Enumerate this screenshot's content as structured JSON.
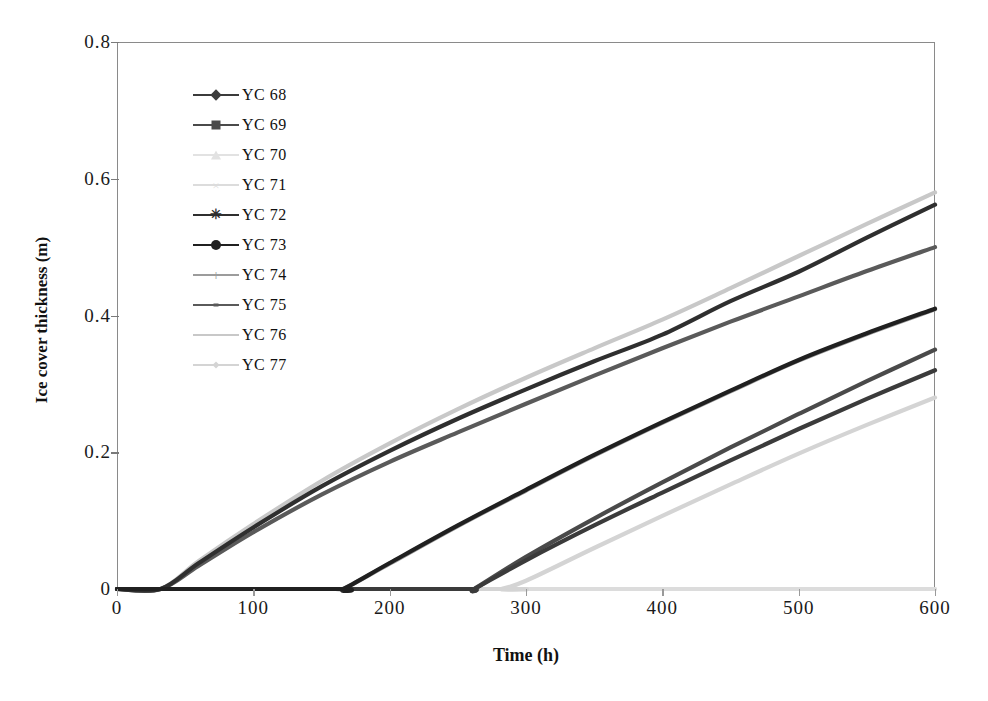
{
  "chart_data": {
    "type": "line",
    "title": "",
    "xlabel": "Time (h)",
    "ylabel": "Ice cover thickness (m)",
    "xlim": [
      0,
      600
    ],
    "ylim": [
      0,
      0.8
    ],
    "xticks": [
      0,
      100,
      200,
      300,
      400,
      500,
      600
    ],
    "yticks": [
      "0",
      "0.2",
      "0.4",
      "0.6",
      "0.8"
    ],
    "xtick_labels": [
      "0",
      "100",
      "200",
      "300",
      "400",
      "500",
      "600"
    ],
    "grid": false,
    "legend_position": "upper-left-inside",
    "series": [
      {
        "name": "YC 68",
        "marker": "diamond",
        "color": "#3b3b3b",
        "onset_h": 262,
        "final_value": 0.32,
        "x": [
          0,
          100,
          200,
          260,
          262,
          300,
          350,
          400,
          450,
          500,
          550,
          600
        ],
        "values": [
          0,
          0,
          0,
          0,
          0,
          0.042,
          0.093,
          0.141,
          0.188,
          0.234,
          0.278,
          0.32
        ]
      },
      {
        "name": "YC 69",
        "marker": "square",
        "color": "#4a4a4a",
        "onset_h": 262,
        "final_value": 0.35,
        "x": [
          0,
          100,
          200,
          260,
          262,
          300,
          350,
          400,
          450,
          500,
          550,
          600
        ],
        "values": [
          0,
          0,
          0,
          0,
          0,
          0.047,
          0.103,
          0.156,
          0.207,
          0.256,
          0.304,
          0.35
        ]
      },
      {
        "name": "YC 70",
        "marker": "triangle",
        "color": "#e2e2e2",
        "onset_h": null,
        "final_value": 0.0,
        "x": [
          0,
          100,
          200,
          300,
          400,
          500,
          600
        ],
        "values": [
          0,
          0,
          0,
          0,
          0,
          0,
          0
        ]
      },
      {
        "name": "YC 71",
        "marker": "cross-x",
        "color": "#dcdcdc",
        "onset_h": null,
        "final_value": 0.0,
        "x": [
          0,
          100,
          200,
          300,
          400,
          500,
          600
        ],
        "values": [
          0,
          0,
          0,
          0,
          0,
          0,
          0
        ]
      },
      {
        "name": "YC 72",
        "marker": "star-x",
        "color": "#2f2f2f",
        "onset_h": 32,
        "final_value": 0.562,
        "x": [
          0,
          32,
          60,
          100,
          150,
          200,
          250,
          300,
          350,
          400,
          450,
          500,
          550,
          600
        ],
        "values": [
          0,
          0,
          0.038,
          0.09,
          0.15,
          0.202,
          0.249,
          0.292,
          0.333,
          0.372,
          0.421,
          0.464,
          0.514,
          0.562
        ]
      },
      {
        "name": "YC 73",
        "marker": "circle",
        "color": "#202020",
        "onset_h": 166,
        "final_value": 0.41,
        "x": [
          0,
          160,
          166,
          200,
          250,
          300,
          350,
          400,
          450,
          500,
          550,
          600
        ],
        "values": [
          0,
          0,
          0,
          0.038,
          0.093,
          0.145,
          0.196,
          0.244,
          0.29,
          0.335,
          0.374,
          0.41
        ]
      },
      {
        "name": "YC 74",
        "marker": "plus",
        "color": "#9c9c9c",
        "onset_h": 166,
        "final_value": 0.41,
        "x": [
          0,
          160,
          166,
          200,
          250,
          300,
          350,
          400,
          450,
          500,
          550,
          600
        ],
        "values": [
          0,
          0,
          0,
          0.037,
          0.092,
          0.144,
          0.195,
          0.243,
          0.289,
          0.334,
          0.373,
          0.409
        ]
      },
      {
        "name": "YC 75",
        "marker": "line-dot",
        "color": "#5a5a5a",
        "onset_h": 32,
        "final_value": 0.5,
        "x": [
          0,
          32,
          60,
          100,
          150,
          200,
          250,
          300,
          350,
          400,
          450,
          500,
          550,
          600
        ],
        "values": [
          0,
          0,
          0.034,
          0.083,
          0.138,
          0.186,
          0.229,
          0.271,
          0.312,
          0.352,
          0.391,
          0.428,
          0.465,
          0.5
        ]
      },
      {
        "name": "YC 76",
        "marker": "line-plain",
        "color": "#c8c8c8",
        "onset_h": 32,
        "final_value": 0.58,
        "x": [
          0,
          32,
          60,
          100,
          150,
          200,
          250,
          300,
          350,
          400,
          450,
          500,
          550,
          600
        ],
        "values": [
          0,
          0,
          0.041,
          0.095,
          0.158,
          0.213,
          0.263,
          0.309,
          0.352,
          0.394,
          0.44,
          0.487,
          0.534,
          0.58
        ]
      },
      {
        "name": "YC 77",
        "marker": "small-diamond",
        "color": "#d4d4d4",
        "onset_h": 282,
        "final_value": 0.28,
        "x": [
          0,
          280,
          282,
          300,
          350,
          400,
          450,
          500,
          550,
          600
        ],
        "values": [
          0,
          0,
          0,
          0.012,
          0.06,
          0.107,
          0.153,
          0.198,
          0.24,
          0.28
        ]
      }
    ]
  },
  "legend": {
    "items": [
      {
        "label": "YC 68"
      },
      {
        "label": "YC 69"
      },
      {
        "label": "YC 70"
      },
      {
        "label": "YC 71"
      },
      {
        "label": "YC 72"
      },
      {
        "label": "YC 73"
      },
      {
        "label": "YC 74"
      },
      {
        "label": "YC 75"
      },
      {
        "label": "YC 76"
      },
      {
        "label": "YC 77"
      }
    ]
  }
}
